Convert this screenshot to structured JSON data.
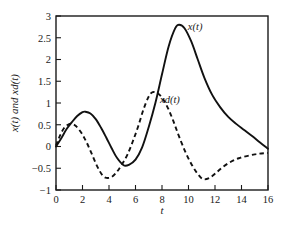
{
  "figure": {
    "background_color": "#ffffff",
    "line_color": "#111111"
  },
  "chart_data": {
    "type": "line",
    "title": "",
    "subtitle": "",
    "xlabel": "t",
    "ylabel": "x(t) and xd(t)",
    "xlim": [
      0,
      16
    ],
    "ylim": [
      -1,
      3
    ],
    "xticks": [
      0,
      2,
      4,
      6,
      8,
      10,
      12,
      14,
      16
    ],
    "xtick_labels": [
      "0",
      "2",
      "4",
      "6",
      "8",
      "10",
      "12",
      "14",
      "16"
    ],
    "yticks": [
      -1,
      -0.5,
      0,
      0.5,
      1,
      1.5,
      2,
      2.5,
      3
    ],
    "ytick_labels": [
      "−1",
      "−0.5",
      "0",
      "0.5",
      "1",
      "1.5",
      "2",
      "2.5",
      "3"
    ],
    "grid": false,
    "legend_position": "inline-annotations",
    "annotations": [
      {
        "name": "x-curve-label",
        "text": "x(t)",
        "x": 10.5,
        "y": 2.67
      },
      {
        "name": "xd-curve-label",
        "text": "xd(t)",
        "x": 8.6,
        "y": 1.0
      }
    ],
    "series": [
      {
        "name": "x(t)",
        "style": "solid",
        "color": "#111111",
        "x": [
          0,
          0.4,
          0.8,
          1.2,
          1.6,
          2.0,
          2.2,
          2.6,
          3.0,
          3.4,
          3.8,
          4.2,
          4.6,
          5.1,
          5.5,
          6.0,
          6.5,
          7.0,
          7.5,
          8.0,
          8.5,
          9.0,
          9.3,
          9.7,
          10.2,
          10.7,
          11.2,
          11.8,
          12.4,
          13.0,
          13.6,
          14.2,
          14.8,
          15.4,
          16.0
        ],
        "y": [
          0.0,
          0.19,
          0.4,
          0.56,
          0.7,
          0.79,
          0.8,
          0.76,
          0.63,
          0.43,
          0.2,
          -0.04,
          -0.26,
          -0.43,
          -0.42,
          -0.3,
          -0.02,
          0.45,
          1.0,
          1.66,
          2.3,
          2.72,
          2.8,
          2.72,
          2.42,
          2.0,
          1.58,
          1.18,
          0.9,
          0.68,
          0.52,
          0.38,
          0.24,
          0.09,
          -0.05
        ]
      },
      {
        "name": "xd(t)",
        "style": "dashed",
        "color": "#111111",
        "x": [
          0,
          0.3,
          0.6,
          0.9,
          1.2,
          1.5,
          1.9,
          2.3,
          2.7,
          3.1,
          3.5,
          3.8,
          4.2,
          4.6,
          5.0,
          5.4,
          5.8,
          6.2,
          6.6,
          7.0,
          7.3,
          7.7,
          8.1,
          8.5,
          8.9,
          9.3,
          9.8,
          10.3,
          10.7,
          11.1,
          11.6,
          12.1,
          12.6,
          13.2,
          13.8,
          14.4,
          15.0,
          15.5,
          16.0
        ],
        "y": [
          0.02,
          0.25,
          0.42,
          0.5,
          0.52,
          0.47,
          0.32,
          0.1,
          -0.17,
          -0.45,
          -0.66,
          -0.72,
          -0.7,
          -0.58,
          -0.4,
          -0.18,
          0.12,
          0.46,
          0.85,
          1.15,
          1.25,
          1.22,
          1.08,
          0.85,
          0.55,
          0.22,
          -0.15,
          -0.45,
          -0.63,
          -0.75,
          -0.72,
          -0.6,
          -0.47,
          -0.35,
          -0.27,
          -0.22,
          -0.18,
          -0.16,
          -0.15
        ]
      }
    ]
  }
}
